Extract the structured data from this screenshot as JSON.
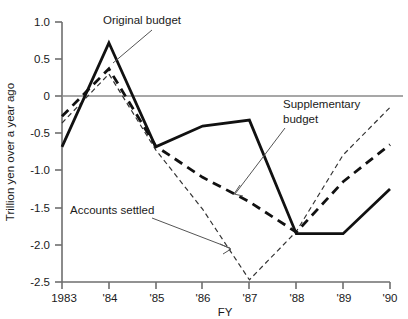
{
  "chart_data": {
    "type": "line",
    "title": "",
    "xlabel": "FY",
    "ylabel": "Trillion yen over a year ago",
    "x": [
      1983,
      1984,
      1985,
      1986,
      1987,
      1988,
      1989,
      1990
    ],
    "xtick_labels": [
      "1983",
      "'84",
      "'85",
      "'86",
      "'87",
      "'88",
      "'89",
      "'90"
    ],
    "ytick_labels": [
      "1.0",
      "0.5",
      "0",
      "-0.5",
      "-1.0",
      "-1.5",
      "-2.0",
      "-2.5"
    ],
    "ytick_values": [
      1.0,
      0.5,
      0,
      -0.5,
      -1.0,
      -1.5,
      -2.0,
      -2.5
    ],
    "ylim": [
      -2.5,
      1.0
    ],
    "xlim": [
      1983,
      1990
    ],
    "grid": false,
    "zero_line": true,
    "legend_position": "inline-annotations",
    "series": [
      {
        "name": "Original budget",
        "style": "solid",
        "width": 2.6,
        "color": "#111111",
        "values": [
          -0.68,
          0.72,
          -0.68,
          -0.4,
          -0.32,
          -1.85,
          -1.85,
          -1.25
        ]
      },
      {
        "name": "Supplementary budget",
        "style": "dashed-thick",
        "width": 2.6,
        "color": "#111111",
        "values": [
          -0.27,
          0.37,
          -0.67,
          -1.09,
          -1.42,
          -1.83,
          -1.15,
          -0.65
        ]
      },
      {
        "name": "Accounts settled",
        "style": "dashed-thin",
        "width": 1.2,
        "color": "#333333",
        "values": [
          -0.36,
          0.3,
          -0.72,
          -1.52,
          -2.47,
          -1.82,
          -0.79,
          -0.15
        ]
      }
    ],
    "annotations": [
      {
        "text": "Original budget",
        "target_series": "Original budget",
        "target_x": 1984
      },
      {
        "text": "Supplementary budget",
        "target_series": "Supplementary budget",
        "target_x": 1987
      },
      {
        "text": "Accounts settled",
        "target_series": "Accounts settled",
        "target_x": 1987
      }
    ]
  },
  "labels": {
    "ylabel": "Trillion yen over a year ago",
    "xlabel": "FY",
    "annot_original": "Original budget",
    "annot_supplementary_line1": "Supplementary",
    "annot_supplementary_line2": "budget",
    "annot_accounts": "Accounts settled"
  }
}
